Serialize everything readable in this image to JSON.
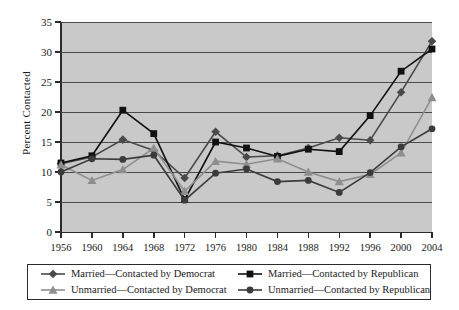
{
  "chart_data": {
    "type": "line",
    "title": "",
    "xlabel": "",
    "ylabel": "Percent Contacted",
    "grid": true,
    "legend_position": "bottom",
    "xlim": [
      1956,
      2004
    ],
    "ylim": [
      0,
      35
    ],
    "ytick_labels": [
      "0",
      "5",
      "10",
      "15",
      "20",
      "25",
      "30",
      "35"
    ],
    "ytick_values": [
      0,
      5,
      10,
      15,
      20,
      25,
      30,
      35
    ],
    "categories": [
      "1956",
      "1960",
      "1964",
      "1968",
      "1972",
      "1976",
      "1980",
      "1984",
      "1988",
      "1992",
      "1996",
      "2000",
      "2004"
    ],
    "x": [
      1956,
      1960,
      1964,
      1968,
      1972,
      1976,
      1980,
      1984,
      1988,
      1992,
      1996,
      2000,
      2004
    ],
    "series": [
      {
        "name": "Married—Contacted by Democrat",
        "marker": "diamond",
        "color": "#4a4a4a",
        "values": [
          11.4,
          12.5,
          15.4,
          13.6,
          9.0,
          16.7,
          12.5,
          12.7,
          14.0,
          15.7,
          15.3,
          23.3,
          31.8
        ]
      },
      {
        "name": "Married—Contacted by Republican",
        "marker": "square",
        "color": "#111111",
        "values": [
          11.5,
          12.7,
          20.3,
          16.4,
          5.4,
          15.0,
          14.0,
          12.6,
          13.8,
          13.4,
          19.4,
          26.8,
          30.5
        ]
      },
      {
        "name": "Unmarried—Contacted by Democrat",
        "marker": "triangle",
        "color": "#8e8e8e",
        "values": [
          11.2,
          8.6,
          10.4,
          14.0,
          6.8,
          11.8,
          11.3,
          12.2,
          10.0,
          8.4,
          9.6,
          13.2,
          22.4
        ]
      },
      {
        "name": "Unmarried—Contacted by Republican",
        "marker": "circle",
        "color": "#3b3b3b",
        "values": [
          10.0,
          12.2,
          12.1,
          12.8,
          5.3,
          9.8,
          10.5,
          8.4,
          8.6,
          6.6,
          9.9,
          14.2,
          17.2
        ]
      }
    ]
  },
  "legend": {
    "items": [
      {
        "label": "Married—Contacted by Democrat"
      },
      {
        "label": "Married—Contacted by Republican"
      },
      {
        "label": "Unmarried—Contacted by Democrat"
      },
      {
        "label": "Unmarried—Contacted by Republican"
      }
    ]
  }
}
